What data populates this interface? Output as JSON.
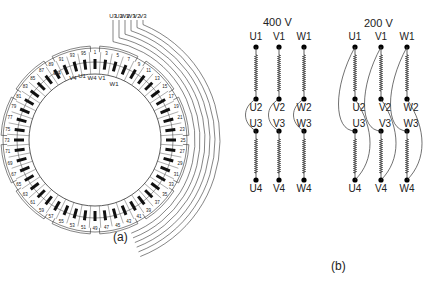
{
  "panel_a": {
    "caption": "(a)",
    "top_leads": [
      "U3",
      "U2",
      "W2",
      "W3",
      "V2",
      "V3"
    ],
    "inner_terminals": [
      "U4",
      "V4",
      "U1",
      "W4",
      "V1",
      "W1"
    ],
    "slot_count": 48,
    "slot_numbers_sample": [
      "1",
      "3",
      "5",
      "7",
      "9",
      "11",
      "13",
      "15",
      "17",
      "19",
      "21",
      "23",
      "25",
      "27",
      "29",
      "31",
      "33",
      "35",
      "37",
      "39",
      "41",
      "43",
      "45",
      "47",
      "49",
      "51",
      "53",
      "55",
      "57",
      "59",
      "61",
      "63",
      "65",
      "67",
      "69",
      "71",
      "73",
      "75",
      "77",
      "79",
      "81",
      "83",
      "85",
      "87",
      "89",
      "91",
      "93",
      "95"
    ]
  },
  "panel_b": {
    "caption": "(b)",
    "config_400": {
      "title": "400 V",
      "top": [
        "U1",
        "V1",
        "W1"
      ],
      "mid_upper": [
        "U2",
        "V2",
        "W2"
      ],
      "mid_lower": [
        "U3",
        "V3",
        "W3"
      ],
      "bottom": [
        "U4",
        "V4",
        "W4"
      ]
    },
    "config_200": {
      "title": "200 V",
      "top": [
        "U1",
        "V1",
        "W1"
      ],
      "mid_upper": [
        "U2",
        "V2",
        "W2"
      ],
      "mid_lower": [
        "U3",
        "V3",
        "W3"
      ],
      "bottom": [
        "U4",
        "V4",
        "W4"
      ]
    }
  },
  "colors": {
    "line": "#333333",
    "coil": "#111111",
    "background": "#ffffff"
  }
}
